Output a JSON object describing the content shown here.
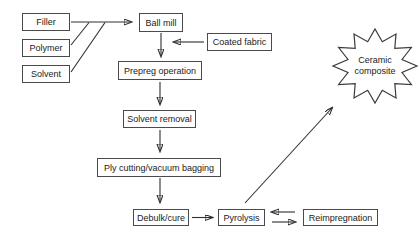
{
  "diagram_type": "flowchart",
  "colors": {
    "background": "#ffffff",
    "line": "#2f2f2f",
    "box_border": "#4a4a4a",
    "text": "#222222"
  },
  "nodes": {
    "filler": {
      "label": "Filler",
      "shape": "rect"
    },
    "polymer": {
      "label": "Polymer",
      "shape": "rect"
    },
    "solvent": {
      "label": "Solvent",
      "shape": "rect"
    },
    "ball_mill": {
      "label": "Ball mill",
      "shape": "rect"
    },
    "coated_fabric": {
      "label": "Coated fabric",
      "shape": "rect"
    },
    "prepreg_operation": {
      "label": "Prepreg operation",
      "shape": "rect"
    },
    "solvent_removal": {
      "label": "Solvent removal",
      "shape": "rect"
    },
    "ply_cutting_vacuum_bagging": {
      "label": "Ply cutting/vacuum bagging",
      "shape": "rect"
    },
    "debulk_cure": {
      "label": "Debulk/cure",
      "shape": "rect"
    },
    "pyrolysis": {
      "label": "Pyrolysis",
      "shape": "rect"
    },
    "reimpregnation": {
      "label": "Reimpregnation",
      "shape": "rect"
    },
    "ceramic_composite": {
      "label": "Ceramic composite",
      "shape": "starburst"
    }
  },
  "edges": [
    {
      "from": "filler",
      "to": "ball_mill",
      "style": "arrow"
    },
    {
      "from": "polymer",
      "to": "ball_mill",
      "style": "merge-line"
    },
    {
      "from": "solvent",
      "to": "ball_mill",
      "style": "merge-line"
    },
    {
      "from": "ball_mill",
      "to": "prepreg_operation",
      "style": "arrow"
    },
    {
      "from": "coated_fabric",
      "to": "prepreg_operation",
      "style": "arrow"
    },
    {
      "from": "prepreg_operation",
      "to": "solvent_removal",
      "style": "arrow"
    },
    {
      "from": "solvent_removal",
      "to": "ply_cutting_vacuum_bagging",
      "style": "arrow"
    },
    {
      "from": "ply_cutting_vacuum_bagging",
      "to": "debulk_cure",
      "style": "arrow"
    },
    {
      "from": "debulk_cure",
      "to": "pyrolysis",
      "style": "arrow"
    },
    {
      "from": "pyrolysis",
      "to": "reimpregnation",
      "style": "arrow"
    },
    {
      "from": "reimpregnation",
      "to": "pyrolysis",
      "style": "arrow"
    },
    {
      "from": "pyrolysis",
      "to": "ceramic_composite",
      "style": "arrow"
    }
  ]
}
